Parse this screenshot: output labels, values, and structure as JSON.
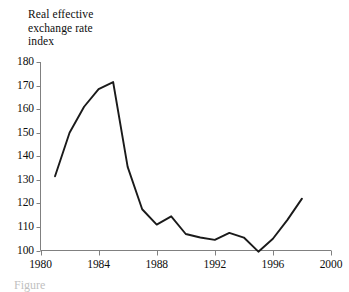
{
  "figure": {
    "background_color": "#ffffff",
    "line_color": "#1a1a1a",
    "axis_color": "#808080",
    "text_color": "#0d0d0d",
    "caption_fragment": "Figure"
  },
  "chart_data": {
    "type": "line",
    "title": "Real effective\nexchange rate\nindex",
    "title_lines": [
      "Real effective",
      "exchange rate",
      "index"
    ],
    "xlabel": "",
    "ylabel": "",
    "xlim": [
      1980,
      2000
    ],
    "ylim": [
      100,
      180
    ],
    "xticks": [
      1980,
      1984,
      1988,
      1992,
      1996,
      2000
    ],
    "yticks": [
      100,
      110,
      120,
      130,
      140,
      150,
      160,
      170,
      180
    ],
    "xtick_labels": [
      "1980",
      "1984",
      "1988",
      "1992",
      "1996",
      "2000"
    ],
    "ytick_labels": [
      "180",
      "170",
      "160",
      "150",
      "140",
      "130",
      "120",
      "110",
      "100"
    ],
    "grid": false,
    "legend": false,
    "series": [
      {
        "name": "Real effective exchange rate index",
        "x": [
          1981,
          1982,
          1983,
          1984,
          1985,
          1986,
          1987,
          1988,
          1989,
          1990,
          1991,
          1992,
          1993,
          1994,
          1995,
          1996,
          1997,
          1998
        ],
        "values": [
          131.5,
          150.0,
          161.0,
          168.5,
          171.5,
          135.5,
          117.5,
          111.0,
          114.5,
          107.0,
          105.5,
          104.5,
          107.5,
          105.5,
          99.5,
          105.0,
          113.0,
          122.0
        ]
      }
    ]
  }
}
